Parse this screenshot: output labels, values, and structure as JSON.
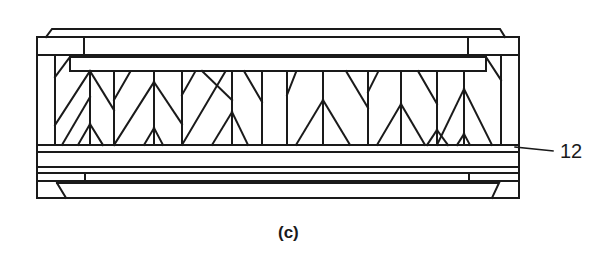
{
  "figure": {
    "caption": "(c)",
    "type": "truss cross-section drawing",
    "callouts": [
      {
        "label": "12",
        "target": "bottom-rail"
      }
    ],
    "colors": {
      "line": "#1a1a1a",
      "background": "#ffffff"
    }
  }
}
